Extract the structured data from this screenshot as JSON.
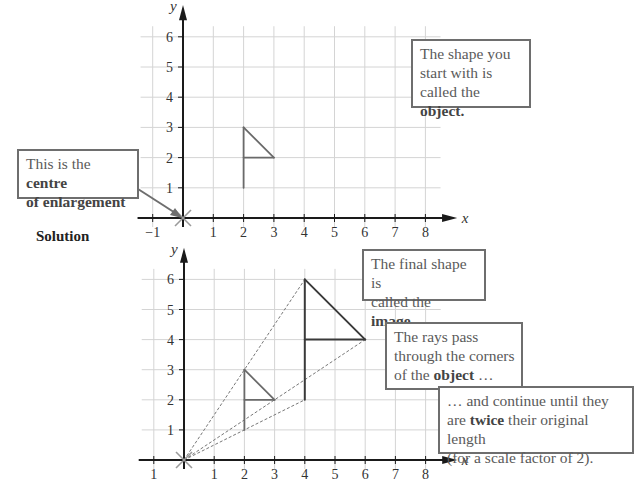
{
  "section_label": "Solution",
  "callouts": {
    "centre": {
      "pre": "This is the ",
      "bold1": "centre",
      "line2_bold": "of enlargement"
    },
    "object": {
      "line1": "The shape you",
      "line2": "start with is",
      "line3_pre": "called the ",
      "line3_bold": "object."
    },
    "image": {
      "line1": "The final shape is",
      "line2_pre": "called the ",
      "line2_bold": "image."
    },
    "rays": {
      "line1": "The rays pass",
      "line2": "through the corners",
      "line3_pre": "of the ",
      "line3_bold": "object",
      "line3_post": " …"
    },
    "continue": {
      "line1": "… and continue until they",
      "line2_pre": "are ",
      "line2_bold": "twice",
      "line2_post": " their original length",
      "line3": "(for a scale factor of 2)."
    }
  },
  "chart_data": [
    {
      "type": "diagram",
      "title": "",
      "xlabel": "x",
      "ylabel": "y",
      "xlim": [
        -1,
        8
      ],
      "ylim": [
        0,
        6
      ],
      "x_ticks": [
        "−1",
        "1",
        "2",
        "3",
        "4",
        "5",
        "6",
        "7",
        "8"
      ],
      "y_ticks": [
        "1",
        "2",
        "3",
        "4",
        "5",
        "6"
      ],
      "grid": true,
      "centre_of_enlargement": [
        0,
        0
      ],
      "object": {
        "segments": [
          [
            [
              2,
              1
            ],
            [
              2,
              3
            ]
          ],
          [
            [
              2,
              3
            ],
            [
              3,
              2
            ]
          ],
          [
            [
              2,
              2
            ],
            [
              3,
              2
            ]
          ]
        ]
      }
    },
    {
      "type": "diagram",
      "title": "",
      "xlabel": "x",
      "ylabel": "y",
      "xlim": [
        -1,
        8
      ],
      "ylim": [
        0,
        6
      ],
      "x_ticks": [
        "1",
        "1",
        "2",
        "3",
        "4",
        "5",
        "6",
        "7",
        "8"
      ],
      "y_ticks": [
        "1",
        "2",
        "3",
        "4",
        "5",
        "6"
      ],
      "grid": true,
      "centre_of_enlargement": [
        0,
        0
      ],
      "scale_factor": 2,
      "object": {
        "segments": [
          [
            [
              2,
              1
            ],
            [
              2,
              3
            ]
          ],
          [
            [
              2,
              3
            ],
            [
              3,
              2
            ]
          ],
          [
            [
              2,
              2
            ],
            [
              3,
              2
            ]
          ]
        ]
      },
      "image": {
        "segments": [
          [
            [
              4,
              2
            ],
            [
              4,
              6
            ]
          ],
          [
            [
              4,
              6
            ],
            [
              6,
              4
            ]
          ],
          [
            [
              4,
              4
            ],
            [
              6,
              4
            ]
          ]
        ]
      },
      "rays": [
        [
          [
            0,
            0
          ],
          [
            4,
            6
          ]
        ],
        [
          [
            0,
            0
          ],
          [
            6,
            4
          ]
        ],
        [
          [
            0,
            0
          ],
          [
            4,
            2
          ]
        ]
      ]
    }
  ]
}
